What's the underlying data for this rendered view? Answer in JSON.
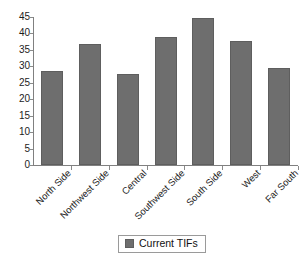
{
  "chart_data": {
    "type": "bar",
    "title": "",
    "subtitle": "",
    "xlabel": "",
    "ylabel": "",
    "categories": [
      "North Side",
      "Northwest Side",
      "Central",
      "Southwest Side",
      "South Side",
      "West",
      "Far South"
    ],
    "series": [
      {
        "name": "Current TIFs",
        "values": [
          28.5,
          36.8,
          27.7,
          38.8,
          44.6,
          37.6,
          29.5
        ],
        "color": "#6e6e6e"
      }
    ],
    "ylim": [
      0,
      45
    ],
    "y_ticks": [
      0,
      5,
      10,
      15,
      20,
      25,
      30,
      35,
      40,
      45
    ],
    "y_tick_labels": [
      "0",
      "5",
      "10",
      "15",
      "20",
      "25",
      "30",
      "35",
      "40",
      "45"
    ],
    "grid": false,
    "legend": {
      "position": "bottom",
      "entries": [
        {
          "label": "Current TIFs",
          "color": "#6e6e6e",
          "swatch": "legend-swatch-icon"
        }
      ]
    },
    "axis": {
      "line_color": "#808080",
      "tick_color": "#8a8a8a"
    },
    "label_rotation_degrees": -45
  }
}
